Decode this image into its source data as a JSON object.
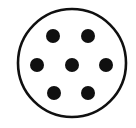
{
  "figure": {
    "name": "dotted-circle-diagram",
    "canvas": {
      "width": 136,
      "height": 128,
      "background_color": "#ffffff"
    },
    "outline": {
      "shape": "circle",
      "center_x": 72,
      "center_y": 63,
      "radius": 54,
      "stroke_color": "#101010",
      "stroke_width": 2.6,
      "fill_color": "#ffffff"
    },
    "dot_style": {
      "fill_color": "#101010",
      "radius": 7
    },
    "dot_count": "7",
    "dots": [
      {
        "id": "dot-top-left",
        "cx": 53,
        "cy": 36,
        "r": 7,
        "row": "top"
      },
      {
        "id": "dot-top-right",
        "cx": 88,
        "cy": 36,
        "r": 7,
        "row": "top"
      },
      {
        "id": "dot-middle-left",
        "cx": 37,
        "cy": 65,
        "r": 7,
        "row": "middle"
      },
      {
        "id": "dot-middle-center",
        "cx": 72,
        "cy": 65,
        "r": 7,
        "row": "middle"
      },
      {
        "id": "dot-middle-right",
        "cx": 106,
        "cy": 65,
        "r": 7,
        "row": "middle"
      },
      {
        "id": "dot-bottom-left",
        "cx": 54,
        "cy": 93,
        "r": 7,
        "row": "bottom"
      },
      {
        "id": "dot-bottom-right",
        "cx": 88,
        "cy": 93,
        "r": 7,
        "row": "bottom"
      }
    ]
  }
}
